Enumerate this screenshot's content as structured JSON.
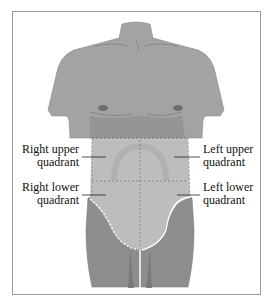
{
  "figure": {
    "labels": {
      "right_upper": {
        "line1": "Right upper",
        "line2": "quadrant"
      },
      "left_upper": {
        "line1": "Left upper",
        "line2": "quadrant"
      },
      "right_lower": {
        "line1": "Right lower",
        "line2": "quadrant"
      },
      "left_lower": {
        "line1": "Left lower",
        "line2": "quadrant"
      }
    },
    "colors": {
      "skin": "#a3a3a3",
      "skin_dark": "#8d8d8d",
      "abdomen": "#bdbdbd",
      "outline": "#7a7a7a",
      "frame": "#9a9a9a"
    }
  }
}
